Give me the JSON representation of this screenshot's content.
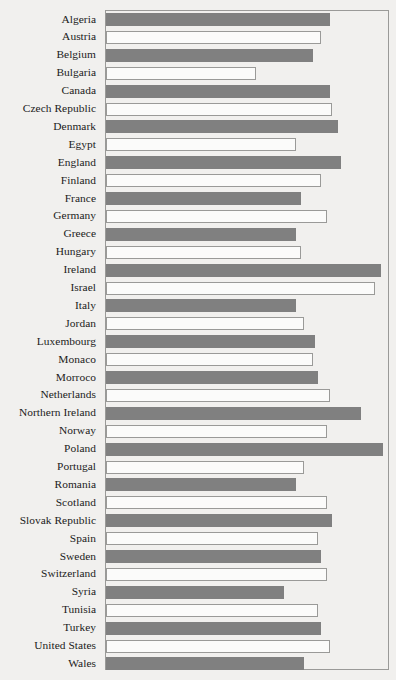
{
  "chart_data": {
    "type": "bar",
    "orientation": "horizontal",
    "title": "",
    "xlabel": "",
    "ylabel": "",
    "grid": false,
    "legend": null,
    "xlim": [
      0,
      100
    ],
    "axis_ticks": [],
    "colors": {
      "filled_bar": "#808080",
      "open_bar_fill": "#fbfbfa",
      "open_bar_border": "#9a9a98",
      "frame": "#9a9a98",
      "background": "#f1f0ee",
      "label_text": "#1b1b1b"
    },
    "categories": [
      "Algeria",
      "Austria",
      "Belgium",
      "Bulgaria",
      "Canada",
      "Czech Republic",
      "Denmark",
      "Egypt",
      "England",
      "Finland",
      "France",
      "Germany",
      "Greece",
      "Hungary",
      "Ireland",
      "Israel",
      "Italy",
      "Jordan",
      "Luxembourg",
      "Monaco",
      "Morroco",
      "Netherlands",
      "Northern Ireland",
      "Norway",
      "Poland",
      "Portugal",
      "Romania",
      "Scotland",
      "Slovak Republic",
      "Spain",
      "Sweden",
      "Switzerland",
      "Syria",
      "Tunisia",
      "Turkey",
      "United States",
      "Wales"
    ],
    "values": [
      79,
      76,
      73,
      53,
      79,
      80,
      82,
      67,
      83,
      76,
      69,
      78,
      67,
      69,
      97,
      95,
      67,
      70,
      74,
      73,
      75,
      79,
      90,
      78,
      98,
      70,
      67,
      78,
      80,
      75,
      76,
      78,
      63,
      75,
      76,
      79,
      70
    ],
    "styles": [
      "filled",
      "open",
      "filled",
      "open",
      "filled",
      "open",
      "filled",
      "open",
      "filled",
      "open",
      "filled",
      "open",
      "filled",
      "open",
      "filled",
      "open",
      "filled",
      "open",
      "filled",
      "open",
      "filled",
      "open",
      "filled",
      "open",
      "filled",
      "open",
      "filled",
      "open",
      "filled",
      "open",
      "filled",
      "open",
      "filled",
      "open",
      "filled",
      "open",
      "filled"
    ]
  }
}
